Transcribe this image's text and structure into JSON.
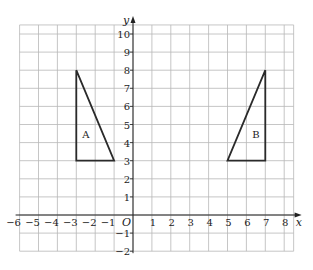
{
  "diagram": {
    "type": "coordinate-grid",
    "x_axis": {
      "label": "x",
      "min": -6,
      "max": 8,
      "ticks": [
        -6,
        -5,
        -4,
        -3,
        -2,
        -1,
        1,
        2,
        3,
        4,
        5,
        6,
        7,
        8
      ]
    },
    "y_axis": {
      "label": "y",
      "min": -2,
      "max": 10,
      "ticks": [
        -2,
        -1,
        1,
        2,
        3,
        4,
        5,
        6,
        7,
        8,
        9,
        10
      ]
    },
    "origin_label": "O",
    "shapes": [
      {
        "label": "A",
        "vertices": [
          [
            -3,
            8
          ],
          [
            -3,
            3
          ],
          [
            -1,
            3
          ]
        ],
        "label_pos": [
          -2.5,
          4.5
        ]
      },
      {
        "label": "B",
        "vertices": [
          [
            7,
            8
          ],
          [
            7,
            3
          ],
          [
            5,
            3
          ]
        ],
        "label_pos": [
          6.5,
          4.5
        ]
      }
    ],
    "colors": {
      "grid": "#b8b8b8",
      "axis": "#222222",
      "shape": "#2a2a2a"
    }
  }
}
